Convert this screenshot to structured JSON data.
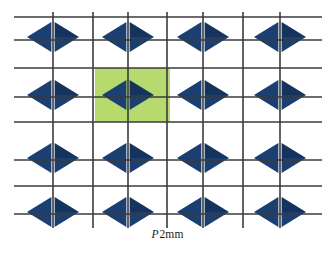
{
  "figure": {
    "caption": {
      "symbol": "P",
      "suffix": "2mm",
      "full": "P2mm"
    },
    "colors": {
      "motif_navy": "#1c3f72",
      "motif_navy_dark": "#16335e",
      "unit_cell_green": "#b7da6e",
      "grid_line": "#3b3b3b",
      "background": "#ffffff",
      "motif_gap": "#ffffff"
    },
    "lattice": {
      "motif_shape": "diamond-quartered",
      "motif_rows": 4,
      "motif_columns": 4,
      "motif_width": 52,
      "motif_height": 30,
      "motif_centers_x": [
        53,
        128,
        203,
        280
      ],
      "motif_centers_y": [
        37,
        95,
        158,
        212
      ],
      "grid_vertical_x": [
        53,
        93,
        128,
        167,
        203,
        243,
        280
      ],
      "grid_horizontal_y": [
        17,
        48,
        67,
        97,
        118,
        147,
        170,
        200
      ],
      "grid_line_width": 1.6,
      "grid_extent": {
        "left": 14,
        "right": 322,
        "top": 17,
        "bottom": 222
      }
    },
    "unit_cell": {
      "label": "highlighted unit cell",
      "x": 95,
      "y": 68,
      "width": 75,
      "height": 54
    }
  }
}
